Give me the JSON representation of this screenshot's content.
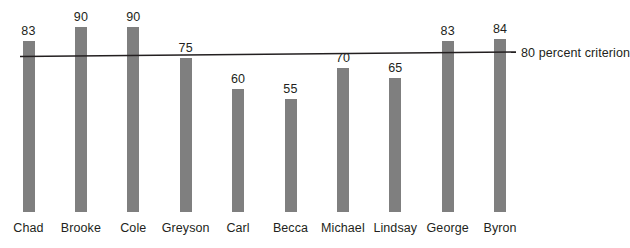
{
  "chart_data": {
    "type": "bar",
    "title": "",
    "subtitle": "",
    "xlabel": "",
    "ylabel": "",
    "ylim": [
      0,
      100
    ],
    "grid": false,
    "legend_position": "right-inline",
    "categories": [
      "Chad",
      "Brooke",
      "Cole",
      "Greyson",
      "Carl",
      "Becca",
      "Michael",
      "Lindsay",
      "George",
      "Byron"
    ],
    "values": [
      83,
      90,
      90,
      75,
      60,
      55,
      70,
      65,
      83,
      84
    ],
    "value_labels": [
      "83",
      "90",
      "90",
      "75",
      "60",
      "55",
      "70",
      "65",
      "83",
      "84"
    ],
    "bar_color": "#7f7f7f",
    "series": [
      {
        "name": "Percent correct",
        "values": [
          83,
          90,
          90,
          75,
          60,
          55,
          70,
          65,
          83,
          84
        ]
      }
    ],
    "reference_line": {
      "label": "80 percent criterion",
      "value": 80,
      "color": "#231f20",
      "style": "solid"
    },
    "annotations": []
  },
  "chart": {
    "criterion_label": "80 percent criterion"
  }
}
